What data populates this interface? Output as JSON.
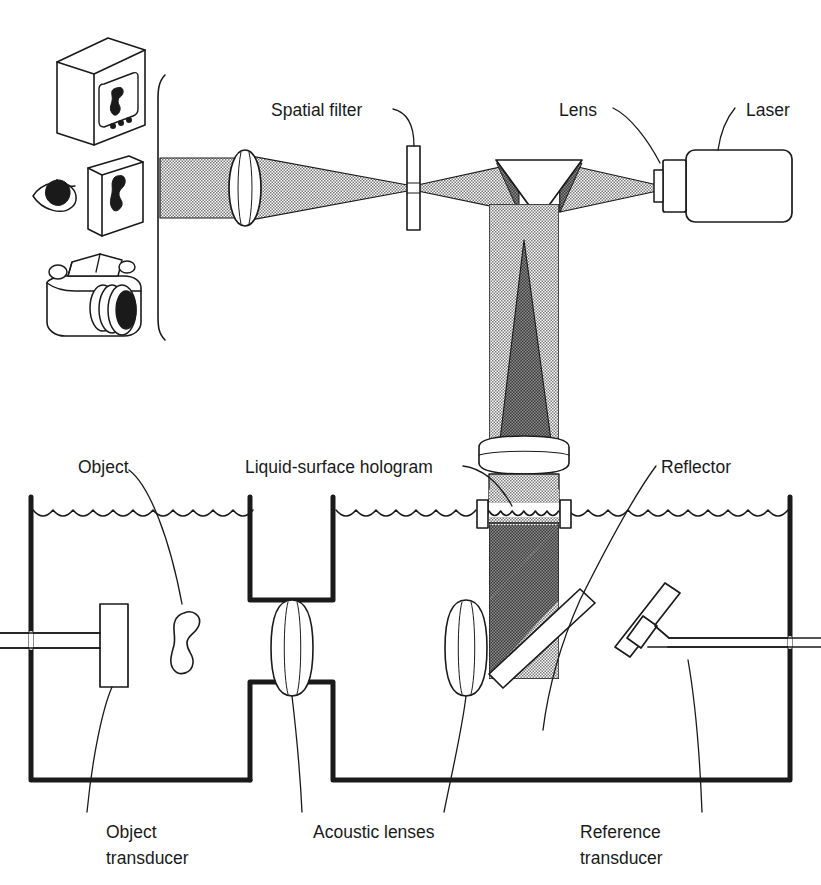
{
  "figure": {
    "background_color": "#ffffff",
    "ink_color": "#1a1a1a"
  },
  "labels": {
    "spatial_filter": "Spatial filter",
    "lens": "Lens",
    "laser": "Laser",
    "liquid_surface_hologram": "Liquid-surface hologram",
    "reflector": "Reflector",
    "object": "Object",
    "object_transducer_line1": "Object",
    "object_transducer_line2": "transducer",
    "acoustic_lenses": "Acoustic lenses",
    "reference_transducer_line1": "Reference",
    "reference_transducer_line2": "transducer"
  },
  "components": {
    "monitor": "tv-monitor",
    "screen": "viewing-screen",
    "eye": "observer-eye",
    "camera": "camera",
    "laser_head": "laser-body",
    "collimator": "laser-collimator",
    "prism": "beam-splitting-prism",
    "spatial_filter_plate": "pinhole-plate",
    "imaging_lens": "imaging-lens",
    "objective_lens": "objective-lens",
    "tank": "water-tank",
    "object_blob": "irregular-object",
    "acoustic_lens_left": "acoustic-lens-left",
    "acoustic_lens_right": "acoustic-lens-right",
    "object_transducer_plate": "object-transducer",
    "reference_transducer_plate": "reference-transducer",
    "reflector_plate": "tilted-reflector",
    "hologram_region": "liquid-surface-hologram-region"
  },
  "colors": {
    "ink": "#1a1a1a",
    "beam_light": "#c9c9c9",
    "beam_dark": "#585858",
    "white": "#ffffff"
  }
}
